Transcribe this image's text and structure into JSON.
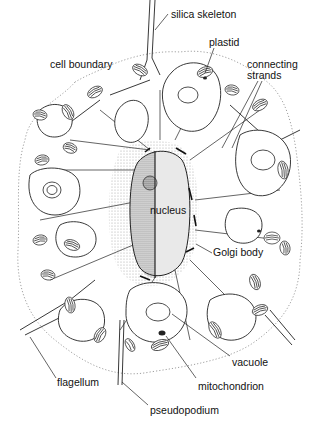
{
  "diagram": {
    "type": "labeled-illustration",
    "labels": [
      {
        "id": "silica-skeleton",
        "text": "silica skeleton",
        "x": 171,
        "y": 9,
        "line": [
          [
            168,
            14
          ],
          [
            155,
            30
          ]
        ]
      },
      {
        "id": "plastid",
        "text": "plastid",
        "x": 209,
        "y": 37,
        "line": [
          [
            214,
            48
          ],
          [
            204,
            72
          ]
        ]
      },
      {
        "id": "cell-boundary",
        "text": "cell boundary",
        "x": 50,
        "y": 59,
        "line": []
      },
      {
        "id": "connecting-strands",
        "text": "connecting\nstrands",
        "x": 247,
        "y": 59,
        "line": [
          [
            258,
            81
          ],
          [
            222,
            148
          ]
        ]
      },
      {
        "id": "nucleus",
        "text": "nucleus",
        "x": 150,
        "y": 205,
        "line": []
      },
      {
        "id": "golgi-body",
        "text": "Golgi body",
        "x": 213,
        "y": 247,
        "line": [
          [
            212,
            253
          ],
          [
            196,
            244
          ]
        ]
      },
      {
        "id": "vacuole",
        "text": "vacuole",
        "x": 232,
        "y": 357,
        "line": [
          [
            230,
            356
          ],
          [
            172,
            314
          ]
        ]
      },
      {
        "id": "flagellum",
        "text": "flagellum",
        "x": 57,
        "y": 377,
        "line": [
          [
            56,
            378
          ],
          [
            30,
            337
          ]
        ]
      },
      {
        "id": "mitochondrion",
        "text": "mitochondrion",
        "x": 198,
        "y": 381,
        "line": [
          [
            196,
            378
          ],
          [
            170,
            337
          ]
        ]
      },
      {
        "id": "pseudopodium",
        "text": "pseudopodium",
        "x": 150,
        "y": 405,
        "line": [
          [
            148,
            405
          ],
          [
            124,
            380
          ]
        ]
      }
    ]
  },
  "colors": {
    "ink": "#222222",
    "boundary": "#8a8a8a",
    "stipple": "#9a9a9a",
    "background": "#ffffff"
  }
}
